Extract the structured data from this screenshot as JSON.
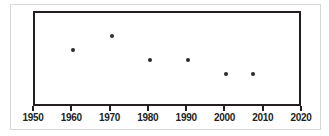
{
  "chart_data": {
    "type": "scatter",
    "title": "",
    "subtitle": "",
    "xlabel": "",
    "ylabel": "",
    "xlim": [
      1950,
      2020
    ],
    "ylim": [
      0,
      100
    ],
    "grid": false,
    "legend": false,
    "x_ticks": [
      1950,
      1960,
      1970,
      1980,
      1990,
      2000,
      2010,
      2020
    ],
    "x_tick_labels": [
      "1950",
      "1960",
      "1970",
      "1980",
      "1990",
      "2000",
      "2010",
      "2020"
    ],
    "y_ticks": [],
    "y_tick_labels": [],
    "series": [
      {
        "name": "series-1",
        "marker": "circle",
        "color": "#2b2b2b",
        "points": [
          {
            "x": 1960,
            "y": 61
          },
          {
            "x": 1970,
            "y": 76
          },
          {
            "x": 1980,
            "y": 51
          },
          {
            "x": 1990,
            "y": 51
          },
          {
            "x": 2000,
            "y": 36
          },
          {
            "x": 2007,
            "y": 36
          }
        ]
      }
    ]
  },
  "figure": {
    "background_color": "#ffffff",
    "frame_color": "#231f20",
    "outer_border_color": "#d8d8d8"
  }
}
